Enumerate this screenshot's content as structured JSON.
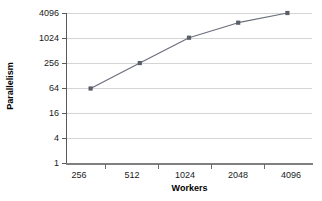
{
  "chart_data": {
    "type": "line",
    "title": "",
    "xlabel": "Workers",
    "ylabel": "Parallelism",
    "categories": [
      "256",
      "512",
      "1024",
      "2048",
      "4096"
    ],
    "x": [
      256,
      512,
      1024,
      2048,
      4096
    ],
    "values": [
      64,
      260,
      1050,
      2400,
      4096
    ],
    "series": [
      {
        "name": "Parallelism",
        "values": [
          64,
          260,
          1050,
          2400,
          4096
        ]
      }
    ],
    "yticks": [
      "1",
      "4",
      "16",
      "64",
      "256",
      "1024",
      "4096"
    ],
    "ytick_values": [
      1,
      4,
      16,
      64,
      256,
      1024,
      4096
    ],
    "yscale": "log",
    "ylim": [
      1,
      4096
    ],
    "grid": true,
    "legend": "none",
    "line_color": "#6b6f7a",
    "marker_color": "#5a5e68",
    "marker_shape": "square",
    "gridline_color": "#d4d4d4",
    "axis_color": "#5a5a5a",
    "background": "#ffffff",
    "annotations": []
  }
}
